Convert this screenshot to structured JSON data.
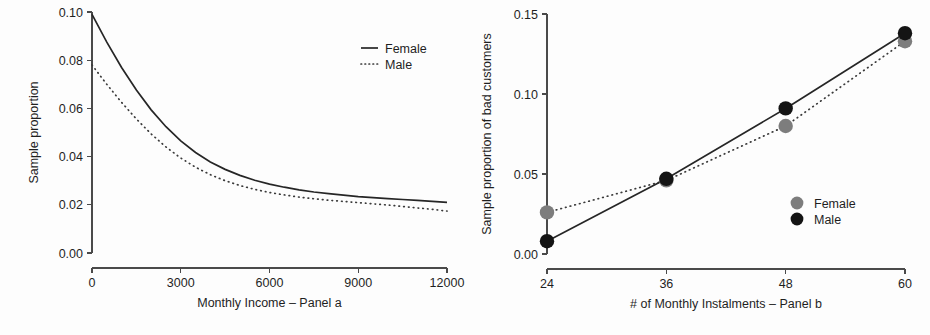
{
  "figure": {
    "background": "#fdfdfd",
    "panel_count": 2
  },
  "chart_data": [
    {
      "id": "panel-a",
      "type": "line",
      "title": "",
      "xlabel": "Monthly Income – Panel a",
      "ylabel": "Sample proportion",
      "xlim": [
        0,
        12000
      ],
      "ylim": [
        0.0,
        0.1
      ],
      "xticks": [
        0,
        3000,
        6000,
        9000,
        12000
      ],
      "xticklabels": [
        "0",
        "3000",
        "6000",
        "9000",
        "12000"
      ],
      "yticks": [
        0.0,
        0.02,
        0.04,
        0.06,
        0.08,
        0.1
      ],
      "yticklabels": [
        "0.00",
        "0.02",
        "0.04",
        "0.06",
        "0.08",
        "0.10"
      ],
      "grid": false,
      "legend_position": "top-right",
      "x": [
        0,
        500,
        1000,
        1500,
        2000,
        2500,
        3000,
        3500,
        4000,
        4500,
        5000,
        5500,
        6000,
        6500,
        7000,
        7500,
        8000,
        8500,
        9000,
        9500,
        10000,
        10500,
        11000,
        11500,
        12000
      ],
      "series": [
        {
          "name": "Female",
          "style": "solid",
          "color": "#262626",
          "values": [
            0.099,
            0.0875,
            0.077,
            0.0676,
            0.0594,
            0.0524,
            0.0465,
            0.0417,
            0.0378,
            0.0347,
            0.0322,
            0.0302,
            0.0286,
            0.0273,
            0.0262,
            0.0253,
            0.0246,
            0.024,
            0.0234,
            0.023,
            0.0226,
            0.0222,
            0.0218,
            0.0214,
            0.021
          ]
        },
        {
          "name": "Male",
          "style": "dotted",
          "color": "#3a3a3a",
          "values": [
            0.078,
            0.07,
            0.0625,
            0.0556,
            0.0494,
            0.044,
            0.0394,
            0.0356,
            0.0325,
            0.03,
            0.028,
            0.0264,
            0.0251,
            0.0241,
            0.0232,
            0.0225,
            0.0219,
            0.0214,
            0.0209,
            0.0204,
            0.0199,
            0.0193,
            0.0187,
            0.0181,
            0.0174
          ]
        }
      ]
    },
    {
      "id": "panel-b",
      "type": "scatter",
      "title": "",
      "xlabel": "# of Monthly Instalments – Panel b",
      "ylabel": "Sample proportion of bad customers",
      "xlim": [
        24,
        60
      ],
      "ylim": [
        0.0,
        0.15
      ],
      "xticks": [
        24,
        36,
        48,
        60
      ],
      "xticklabels": [
        "24",
        "36",
        "48",
        "60"
      ],
      "yticks": [
        0.0,
        0.05,
        0.1,
        0.15
      ],
      "yticklabels": [
        "0.00",
        "0.05",
        "0.10",
        "0.15"
      ],
      "grid": false,
      "legend_position": "lower-right",
      "categories": [
        24,
        36,
        48,
        60
      ],
      "series": [
        {
          "name": "Female",
          "style": "dotted",
          "color": "#7d7d7d",
          "marker": "circle",
          "values": [
            0.026,
            0.046,
            0.08,
            0.133
          ]
        },
        {
          "name": "Male",
          "style": "solid",
          "color": "#141414",
          "marker": "circle",
          "values": [
            0.008,
            0.047,
            0.091,
            0.138
          ]
        }
      ]
    }
  ]
}
